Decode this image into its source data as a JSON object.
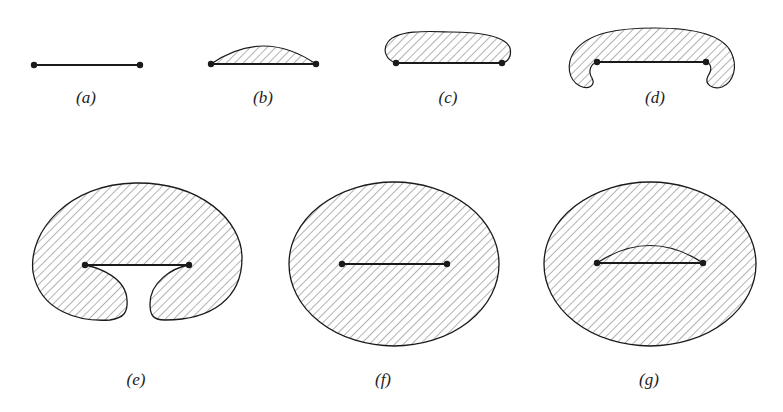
{
  "figure": {
    "ink_color": "#1a1a1a",
    "hatch_color": "#555555",
    "background": "#ffffff",
    "panels": [
      {
        "id": "a",
        "label": "(a)",
        "description": "bare line segment with two endpoints"
      },
      {
        "id": "b",
        "label": "(b)",
        "description": "thin hatched lens above segment"
      },
      {
        "id": "c",
        "label": "(c)",
        "description": "larger hatched dome above segment"
      },
      {
        "id": "d",
        "label": "(d)",
        "description": "hatched region curling around endpoints"
      },
      {
        "id": "e",
        "label": "(e)",
        "description": "hatched region nearly enclosing segment with narrow gap below"
      },
      {
        "id": "f",
        "label": "(f)",
        "description": "hatched ellipse fully enclosing segment"
      },
      {
        "id": "g",
        "label": "(g)",
        "description": "hatched ellipse enclosing segment with inner hatched lens"
      }
    ]
  }
}
